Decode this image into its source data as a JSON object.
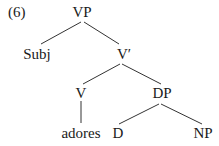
{
  "example_number": "(6)",
  "tree": {
    "root": "VP",
    "nodes": {
      "vp": "VP",
      "subj": "Subj",
      "vbar": "V′",
      "v": "V",
      "dp": "DP",
      "adores": "adores",
      "d": "D",
      "np": "NP"
    },
    "edges": [
      [
        "VP",
        "Subj"
      ],
      [
        "VP",
        "V′"
      ],
      [
        "V′",
        "V"
      ],
      [
        "V′",
        "DP"
      ],
      [
        "V",
        "adores"
      ],
      [
        "DP",
        "D"
      ],
      [
        "DP",
        "NP"
      ]
    ]
  },
  "colors": {
    "line": "#333333",
    "text": "#1a1a1a"
  }
}
